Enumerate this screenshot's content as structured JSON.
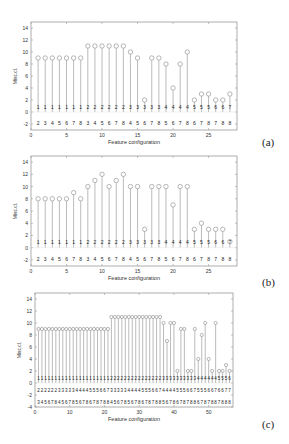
{
  "chart_data": [
    {
      "id": "a",
      "type": "stem",
      "panel_label": "(a)",
      "title": "",
      "xlabel": "Feature configuration",
      "ylabel": "Misc.cl.",
      "xlim": [
        0,
        29
      ],
      "ylim": [
        -3,
        15
      ],
      "xticks": [
        0,
        5,
        10,
        15,
        20,
        25
      ],
      "yticks": [
        -2,
        0,
        2,
        4,
        6,
        8,
        10,
        12,
        14
      ],
      "grid": false,
      "x": [
        1,
        2,
        3,
        4,
        5,
        6,
        7,
        8,
        9,
        10,
        11,
        12,
        13,
        14,
        15,
        16,
        17,
        18,
        19,
        20,
        21,
        22,
        23,
        24,
        25,
        26,
        27,
        28
      ],
      "categories": [
        "12",
        "13",
        "14",
        "15",
        "16",
        "17",
        "18",
        "23",
        "24",
        "25",
        "26",
        "27",
        "28",
        "34",
        "35",
        "36",
        "37",
        "38",
        "45",
        "46",
        "47",
        "48",
        "56",
        "57",
        "58",
        "67",
        "68",
        "78"
      ],
      "values": [
        9,
        9,
        9,
        9,
        9,
        9,
        9,
        11,
        11,
        11,
        11,
        11,
        11,
        10,
        9,
        2,
        9,
        9,
        8,
        4,
        8,
        10,
        2,
        3,
        3,
        2,
        2,
        3
      ],
      "label_rows_y": [
        0.9,
        -1.9
      ]
    },
    {
      "id": "b",
      "type": "stem",
      "panel_label": "(b)",
      "title": "",
      "xlabel": "Feature configuration",
      "ylabel": "Misc.cl.",
      "xlim": [
        0,
        29
      ],
      "ylim": [
        -3,
        15
      ],
      "xticks": [
        0,
        5,
        10,
        15,
        20,
        25
      ],
      "yticks": [
        -2,
        0,
        2,
        4,
        6,
        8,
        10,
        12,
        14
      ],
      "grid": false,
      "x": [
        1,
        2,
        3,
        4,
        5,
        6,
        7,
        8,
        9,
        10,
        11,
        12,
        13,
        14,
        15,
        16,
        17,
        18,
        19,
        20,
        21,
        22,
        23,
        24,
        25,
        26,
        27,
        28
      ],
      "categories": [
        "12",
        "13",
        "14",
        "15",
        "16",
        "17",
        "18",
        "23",
        "24",
        "25",
        "26",
        "27",
        "28",
        "34",
        "35",
        "36",
        "37",
        "38",
        "45",
        "46",
        "47",
        "48",
        "56",
        "57",
        "58",
        "67",
        "68",
        "78"
      ],
      "values": [
        8,
        8,
        8,
        8,
        8,
        9,
        8,
        10,
        11,
        12,
        10,
        11,
        12,
        10,
        10,
        3,
        10,
        10,
        10,
        7,
        10,
        10,
        3,
        4,
        3,
        3,
        3,
        1
      ],
      "label_rows_y": [
        0.9,
        -1.9
      ]
    },
    {
      "id": "c",
      "type": "stem",
      "panel_label": "(c)",
      "title": "",
      "xlabel": "Feature configuration",
      "ylabel": "Misc.cl.",
      "xlim": [
        0,
        57
      ],
      "ylim": [
        -4,
        15
      ],
      "xticks": [
        0,
        10,
        20,
        30,
        40,
        50
      ],
      "yticks": [
        -4,
        -2,
        0,
        2,
        4,
        6,
        8,
        10,
        12,
        14
      ],
      "grid": false,
      "x": [
        1,
        2,
        3,
        4,
        5,
        6,
        7,
        8,
        9,
        10,
        11,
        12,
        13,
        14,
        15,
        16,
        17,
        18,
        19,
        20,
        21,
        22,
        23,
        24,
        25,
        26,
        27,
        28,
        29,
        30,
        31,
        32,
        33,
        34,
        35,
        36,
        37,
        38,
        39,
        40,
        41,
        42,
        43,
        44,
        45,
        46,
        47,
        48,
        49,
        50,
        51,
        52,
        53,
        54,
        55,
        56
      ],
      "categories": [
        "123",
        "124",
        "125",
        "126",
        "127",
        "128",
        "134",
        "135",
        "136",
        "137",
        "138",
        "145",
        "146",
        "147",
        "148",
        "156",
        "157",
        "158",
        "167",
        "168",
        "178",
        "234",
        "235",
        "236",
        "237",
        "238",
        "245",
        "246",
        "247",
        "248",
        "256",
        "257",
        "258",
        "267",
        "268",
        "278",
        "345",
        "346",
        "347",
        "348",
        "356",
        "357",
        "358",
        "367",
        "368",
        "378",
        "456",
        "457",
        "458",
        "467",
        "468",
        "478",
        "567",
        "568",
        "578",
        "678"
      ],
      "values": [
        9,
        9,
        9,
        9,
        9,
        9,
        9,
        9,
        9,
        9,
        9,
        9,
        9,
        9,
        9,
        9,
        9,
        9,
        9,
        9,
        9,
        11,
        11,
        11,
        11,
        11,
        11,
        11,
        11,
        11,
        11,
        11,
        11,
        11,
        11,
        11,
        10,
        7,
        10,
        10,
        2,
        9,
        9,
        2,
        2,
        9,
        4,
        8,
        10,
        4,
        2,
        10,
        2,
        2,
        3,
        2
      ],
      "label_rows_y": [
        0.9,
        -1.2,
        -3.1
      ]
    }
  ],
  "panels": [
    {
      "label": "(a)"
    },
    {
      "label": "(b)"
    },
    {
      "label": "(c)"
    }
  ]
}
